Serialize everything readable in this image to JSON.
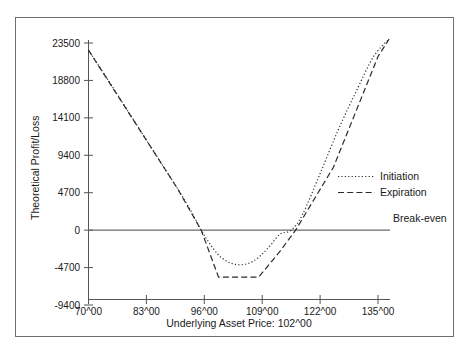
{
  "chart_data": {
    "type": "line",
    "title": "",
    "xlabel": "Underlying Asset Price: 102^00",
    "ylabel": "Theoretical Profit/Loss",
    "xlim": [
      70,
      138
    ],
    "ylim": [
      -9400,
      23500
    ],
    "grid": false,
    "legend_position": "right-middle",
    "x_tick_labels": [
      "70^00",
      "83^00",
      "96^00",
      "109^00",
      "122^00",
      "135^00"
    ],
    "x_tick_values": [
      70,
      83,
      96,
      109,
      122,
      135
    ],
    "y_tick_labels": [
      "23500",
      "18800",
      "14100",
      "9400",
      "4700",
      "0",
      "-4700",
      "-9400"
    ],
    "y_tick_values": [
      23500,
      18800,
      14100,
      9400,
      4700,
      0,
      -4700,
      -9400
    ],
    "series": [
      {
        "name": "Initiation",
        "style": "dotted",
        "x": [
          70,
          74,
          78,
          82,
          86,
          90,
          93,
          95.3,
          97,
          99,
          101,
          103,
          105,
          107,
          109,
          111,
          113,
          115.5,
          118,
          122,
          126,
          130,
          134,
          137.5
        ],
        "values": [
          22600,
          19200,
          15700,
          12200,
          8700,
          5200,
          2400,
          0,
          -1500,
          -3000,
          -3900,
          -4300,
          -4300,
          -3900,
          -3000,
          -1800,
          -500,
          0,
          1900,
          7100,
          12500,
          17300,
          21800,
          24000
        ]
      },
      {
        "name": "Expiration",
        "style": "dashed",
        "x": [
          70,
          80,
          90,
          95.3,
          99.2,
          108.2,
          112.8,
          116.5,
          125,
          135,
          137.5
        ],
        "values": [
          22600,
          13900,
          5200,
          0,
          -5900,
          -5900,
          -2800,
          0,
          7900,
          21800,
          24000
        ]
      },
      {
        "name": "Break-even",
        "style": "solid",
        "x": [
          70,
          138
        ],
        "values": [
          0,
          0
        ]
      }
    ],
    "legend": [
      {
        "label": "Initiation",
        "style": "dotted"
      },
      {
        "label": "Expiration",
        "style": "dashed"
      },
      {
        "label": "Break-even",
        "style": "solid"
      }
    ]
  }
}
